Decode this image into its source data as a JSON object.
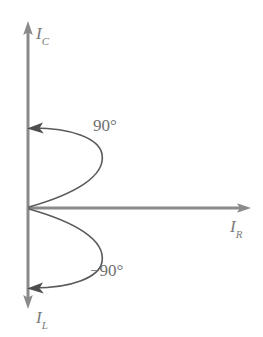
{
  "figure": {
    "kind": "phasor-axes-diagram",
    "width": 263,
    "height": 337,
    "background_color": "#ffffff",
    "axis_color": "#8a8a8a",
    "arc_color": "#5a5a5a",
    "label_color": "#7b7b7b"
  },
  "axes": {
    "origin": {
      "x": 28,
      "y": 208
    },
    "vertical": {
      "name": "imaginary-axis",
      "top_arrow_tip": {
        "x": 28,
        "y": 22
      },
      "bottom_arrow_tip": {
        "x": 28,
        "y": 308
      },
      "top_label": "I",
      "top_label_subscript": "C",
      "bottom_label": "I",
      "bottom_label_subscript": "L"
    },
    "horizontal": {
      "name": "real-axis",
      "right_arrow_tip": {
        "x": 250,
        "y": 208
      },
      "right_label": "I",
      "right_label_subscript": "R"
    }
  },
  "arcs": [
    {
      "name": "positive-ninety-arc",
      "label": "90°",
      "degrees": 90,
      "direction": "counterclockwise",
      "from": {
        "x": 28,
        "y": 208
      },
      "to": {
        "x": 28,
        "y": 128
      },
      "arrow_at": "end"
    },
    {
      "name": "negative-ninety-arc",
      "label": "−90°",
      "degrees": -90,
      "direction": "clockwise",
      "from": {
        "x": 28,
        "y": 208
      },
      "to": {
        "x": 28,
        "y": 288
      },
      "arrow_at": "end"
    }
  ]
}
